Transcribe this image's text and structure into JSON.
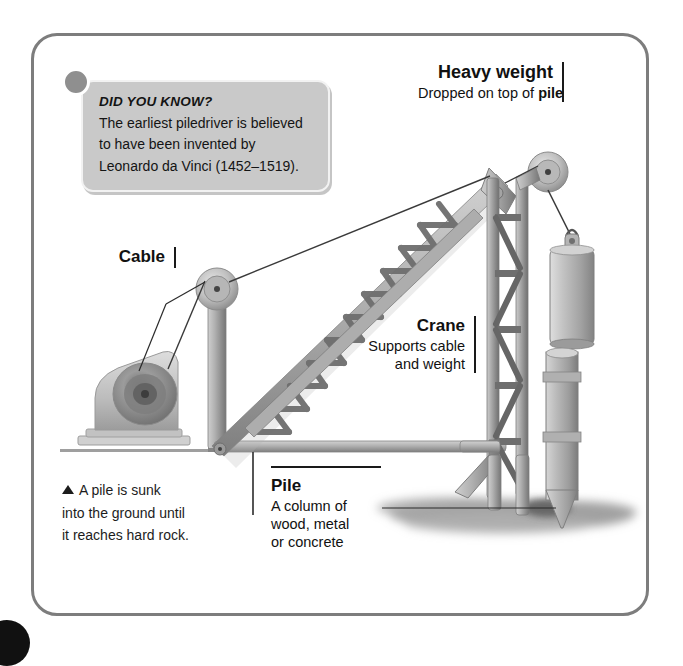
{
  "page": {
    "background_color": "#ffffff",
    "frame_color": "#7d7d7d"
  },
  "did_you_know": {
    "title": "DID YOU KNOW?",
    "line1": "The earliest piledriver is believed",
    "line2": "to have been invented by",
    "line3": "Leonardo da Vinci (1452–1519).",
    "box_color": "#c9c9c9",
    "dot_color": "#8f8f8f"
  },
  "labels": {
    "heavy_weight": {
      "heading": "Heavy weight",
      "sub_prefix": "Dropped on top of ",
      "sub_emphasis": "pile"
    },
    "cable": {
      "heading": "Cable"
    },
    "crane": {
      "heading": "Crane",
      "sub_line1": "Supports cable",
      "sub_line2": "and weight"
    },
    "pile": {
      "heading": "Pile",
      "sub_line1": "A column of",
      "sub_line2": "wood, metal",
      "sub_line3": "or concrete"
    }
  },
  "caption": {
    "bullet": "triangle-up-icon",
    "line1": "A pile is sunk",
    "line2": "into the ground until",
    "line3": "it reaches hard rock."
  },
  "illustration": {
    "parts": [
      "winch-motor",
      "mast-pulley",
      "truss-boom",
      "crane-tower",
      "pulley-head",
      "heavy-weight-block",
      "pile-column",
      "ground-line",
      "soil-patch",
      "cable-line"
    ],
    "metal_light": "#c4c4c4",
    "metal_mid": "#9a9a9a",
    "metal_dark": "#6f6f6f",
    "ground_color": "#a8a8a8",
    "soil_color": "#9e9e9e",
    "cable_color": "#333333"
  }
}
